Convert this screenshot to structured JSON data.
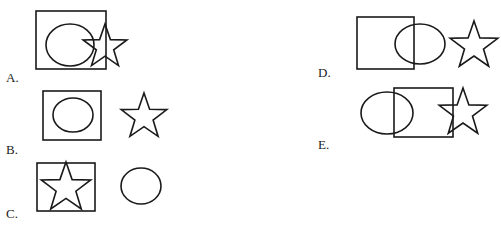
{
  "options": [
    {
      "id": "A",
      "label": "A.",
      "label_pos": [
        6,
        70
      ],
      "square": {
        "x": 36,
        "y": 11,
        "w": 70,
        "h": 58
      },
      "circle": {
        "cx": 70,
        "cy": 45,
        "rx": 24,
        "ry": 21
      },
      "star": {
        "cx": 105,
        "cy": 47,
        "r": 23
      }
    },
    {
      "id": "B",
      "label": "B.",
      "label_pos": [
        6,
        142
      ],
      "square": {
        "x": 43,
        "y": 91,
        "w": 58,
        "h": 49
      },
      "circle": {
        "cx": 73,
        "cy": 115,
        "rx": 20,
        "ry": 17
      },
      "star": {
        "cx": 144,
        "cy": 117,
        "r": 24
      }
    },
    {
      "id": "C",
      "label": "C.",
      "label_pos": [
        6,
        206
      ],
      "square": {
        "x": 37,
        "y": 163,
        "w": 58,
        "h": 48
      },
      "circle": {
        "cx": 141,
        "cy": 186,
        "rx": 20,
        "ry": 18
      },
      "star": {
        "cx": 66,
        "cy": 188,
        "r": 26
      }
    },
    {
      "id": "D",
      "label": "D.",
      "label_pos": [
        318,
        65
      ],
      "square": {
        "x": 357,
        "y": 17,
        "w": 57,
        "h": 52
      },
      "circle": {
        "cx": 420,
        "cy": 44,
        "rx": 25,
        "ry": 20
      },
      "star": {
        "cx": 474,
        "cy": 46,
        "r": 25
      }
    },
    {
      "id": "E",
      "label": "E.",
      "label_pos": [
        318,
        137
      ],
      "square": {
        "x": 394,
        "y": 88,
        "w": 59,
        "h": 49
      },
      "circle": {
        "cx": 387,
        "cy": 113,
        "rx": 26,
        "ry": 21
      },
      "star": {
        "cx": 463,
        "cy": 113,
        "r": 25
      }
    }
  ],
  "icons": {
    "shapes": [
      "square-icon",
      "circle-icon",
      "star-icon"
    ]
  }
}
